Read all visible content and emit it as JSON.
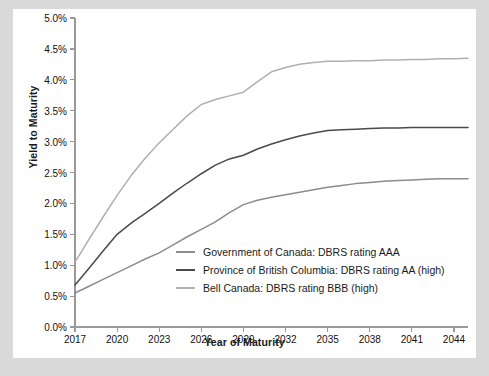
{
  "chart_data": {
    "type": "line",
    "title": "",
    "xlabel": "Year of Maturity",
    "ylabel": "Yield to Maturity",
    "xlim": [
      2017,
      2045
    ],
    "ylim": [
      0,
      5
    ],
    "grid": false,
    "legend_position": "inside-center",
    "x_ticks": [
      "2017",
      "2020",
      "2023",
      "2026",
      "2029",
      "2032",
      "2035",
      "2038",
      "2041",
      "2044"
    ],
    "x_tick_values": [
      2017,
      2020,
      2023,
      2026,
      2029,
      2032,
      2035,
      2038,
      2041,
      2044
    ],
    "y_ticks": [
      "0.0%",
      "0.5%",
      "1.0%",
      "1.5%",
      "2.0%",
      "2.5%",
      "3.0%",
      "3.5%",
      "4.0%",
      "4.5%",
      "5.0%"
    ],
    "y_tick_values": [
      0,
      0.5,
      1,
      1.5,
      2,
      2.5,
      3,
      3.5,
      4,
      4.5,
      5
    ],
    "x": [
      2017,
      2018,
      2019,
      2020,
      2021,
      2022,
      2023,
      2024,
      2025,
      2026,
      2027,
      2028,
      2029,
      2030,
      2031,
      2032,
      2033,
      2034,
      2035,
      2036,
      2037,
      2038,
      2039,
      2040,
      2041,
      2042,
      2043,
      2044,
      2045
    ],
    "series": [
      {
        "name": "Government of Canada: DBRS rating AAA",
        "color": "#8c8c8c",
        "values": [
          0.55,
          0.66,
          0.77,
          0.88,
          0.99,
          1.1,
          1.2,
          1.33,
          1.46,
          1.58,
          1.7,
          1.85,
          1.98,
          2.05,
          2.1,
          2.14,
          2.18,
          2.22,
          2.26,
          2.29,
          2.32,
          2.34,
          2.36,
          2.37,
          2.38,
          2.39,
          2.4,
          2.4,
          2.4
        ]
      },
      {
        "name": "Province of British Columbia: DBRS rating AA (high)",
        "color": "#4a4a4a",
        "values": [
          0.68,
          0.95,
          1.23,
          1.5,
          1.68,
          1.84,
          2.0,
          2.17,
          2.33,
          2.48,
          2.62,
          2.72,
          2.78,
          2.88,
          2.96,
          3.03,
          3.09,
          3.14,
          3.18,
          3.19,
          3.2,
          3.21,
          3.22,
          3.22,
          3.23,
          3.23,
          3.23,
          3.23,
          3.23
        ]
      },
      {
        "name": "Bell Canada: DBRS rating BBB (high)",
        "color": "#b0b0b0",
        "values": [
          1.05,
          1.42,
          1.78,
          2.13,
          2.45,
          2.73,
          2.98,
          3.2,
          3.42,
          3.6,
          3.68,
          3.74,
          3.8,
          3.97,
          4.13,
          4.2,
          4.25,
          4.28,
          4.3,
          4.3,
          4.31,
          4.31,
          4.32,
          4.32,
          4.33,
          4.33,
          4.34,
          4.34,
          4.35
        ]
      }
    ]
  },
  "axis": {
    "line_color": "#999999",
    "text_color": "#111111"
  },
  "legend": {
    "items": [
      {
        "label": "Government of Canada: DBRS rating AAA",
        "color": "#8c8c8c"
      },
      {
        "label": "Province of British Columbia: DBRS rating AA (high)",
        "color": "#4a4a4a"
      },
      {
        "label": "Bell Canada: DBRS rating BBB (high)",
        "color": "#b0b0b0"
      }
    ]
  }
}
